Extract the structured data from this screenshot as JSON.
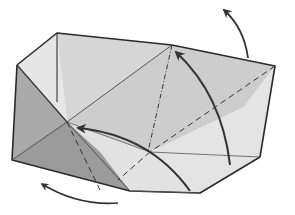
{
  "diagram": {
    "type": "origami-fold-step",
    "colors": {
      "background": "#ffffff",
      "paper_light": "#e4e4e4",
      "paper_mid": "#cfcfcf",
      "paper_shade": "#b9b9b9",
      "paper_dark": "#9a9a9a",
      "outline": "#2a2a2a",
      "arrow": "#333333"
    },
    "arrows": [
      {
        "name": "arrow-top-right-up",
        "direction": "up-left"
      },
      {
        "name": "arrow-center-up",
        "direction": "up"
      },
      {
        "name": "arrow-center-left",
        "direction": "left"
      },
      {
        "name": "arrow-bottom-left",
        "direction": "left"
      }
    ],
    "fold_lines": {
      "dashed": "valley-fold",
      "dash_dot": "mountain-fold"
    }
  }
}
